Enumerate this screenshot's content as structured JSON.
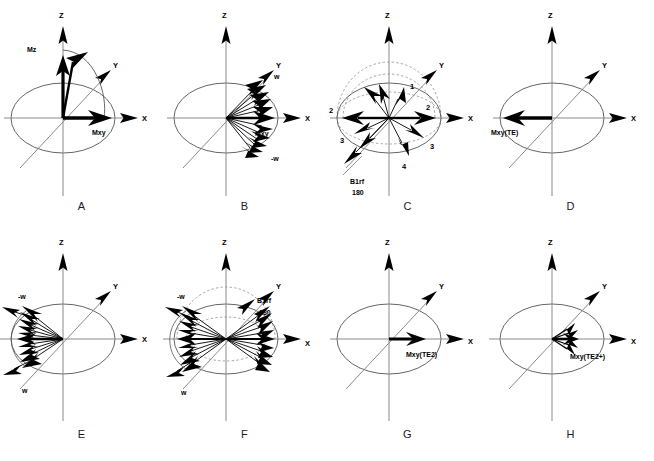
{
  "figure": {
    "panel_count": 8,
    "rows": 2,
    "cols": 4,
    "background": "#ffffff",
    "ink": "#000000",
    "axis_color": "#808080",
    "dashed_color": "#9a9a9a"
  },
  "axes": {
    "z": "Z",
    "y": "Y",
    "x": "X"
  },
  "panels": [
    {
      "letter": "A",
      "labels": {
        "mz": "Mz",
        "mxy": "Mxy"
      },
      "description": "Longitudinal magnetization Mz tipping toward transverse plane giving Mxy along +X"
    },
    {
      "letter": "B",
      "labels": {
        "mxy": "Mxy",
        "w_plus": "w",
        "w_minus": "-w"
      },
      "description": "Dephasing fan of isochromats spreading about +X between w and -w"
    },
    {
      "letter": "C",
      "labels": {
        "b1rf": "B1rf",
        "flip": "180"
      },
      "numbers_left": [
        "2",
        "3"
      ],
      "numbers_right": [
        "1",
        "2",
        "3",
        "4"
      ],
      "description": "180 degree B1rf refocusing pulse flipping isochromats, numbered 1-4"
    },
    {
      "letter": "D",
      "labels": {
        "mxy_te": "Mxy(TE)"
      },
      "description": "Refocused transverse magnetization Mxy(TE) along -X"
    },
    {
      "letter": "E",
      "labels": {
        "w_minus": "-w",
        "w_plus": "w"
      },
      "description": "Isochromats converging toward -X after refocusing"
    },
    {
      "letter": "F",
      "labels": {
        "b1rf": "B1rf",
        "flip": "180",
        "w_minus": "-w",
        "w_plus": "w"
      },
      "description": "Second 180 degree B1rf pulse with bidirectional isochromat fans"
    },
    {
      "letter": "G",
      "labels": {
        "mxy_te2": "Mxy(TE2)"
      },
      "description": "Second echo transverse magnetization Mxy(TE2) along +X"
    },
    {
      "letter": "H",
      "labels": {
        "mxy_te2plus": "Mxy(TE2+)"
      },
      "description": "Magnetization just after second echo Mxy(TE2+) beginning to dephase"
    }
  ]
}
